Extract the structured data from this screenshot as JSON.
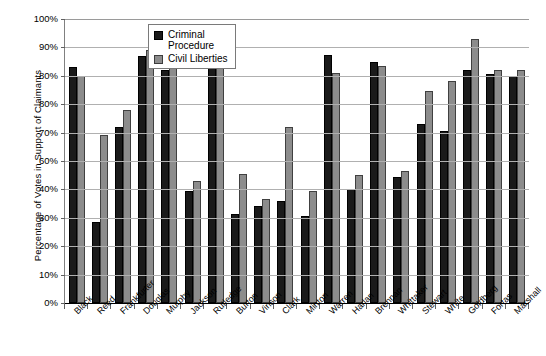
{
  "chart_data": {
    "type": "bar",
    "title": "",
    "xlabel": "",
    "ylabel": "Percentage of Votes in Support of Claimants",
    "ylim": [
      0,
      100
    ],
    "grid": true,
    "legend_position": "top-center",
    "y_tick_labels": [
      "100%",
      "90%",
      "80%",
      "80%",
      "70%",
      "60%",
      "40%",
      "30%",
      "20%",
      "10%",
      "0%"
    ],
    "y_tick_values": [
      100,
      90,
      80,
      70,
      60,
      50,
      40,
      30,
      20,
      10,
      0
    ],
    "categories": [
      "Black",
      "Reed",
      "Frankfurter",
      "Douglas",
      "Murphy",
      "Jackson",
      "Rutledge",
      "Burton",
      "Vinson",
      "Clark",
      "Minton",
      "Warren",
      "Harlan",
      "Brennan",
      "Whittaker",
      "Stewart",
      "White",
      "Goldberg",
      "Fortas",
      "Marshall"
    ],
    "series": [
      {
        "name": "Criminal Procedure",
        "color": "#1a1a1a",
        "values": [
          83,
          28.5,
          62,
          87,
          82,
          39.5,
          85,
          31.5,
          34,
          36,
          30.5,
          87.5,
          40,
          85,
          44.5,
          63,
          60.5,
          82,
          80.5,
          80
        ]
      },
      {
        "name": "Civil Liberties",
        "color": "#8c8c8c",
        "values": [
          80,
          59,
          68,
          89,
          84,
          43,
          85,
          45.5,
          36.5,
          62,
          39.5,
          81,
          45,
          83.5,
          46.5,
          74.5,
          78,
          93,
          82,
          82
        ]
      }
    ]
  },
  "legend": {
    "items": [
      {
        "label": "Criminal\nProcedure",
        "swatch": "cp"
      },
      {
        "label": "Civil Liberties",
        "swatch": "cl"
      }
    ]
  }
}
